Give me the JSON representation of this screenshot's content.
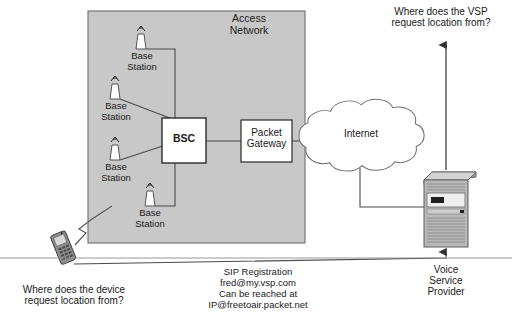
{
  "diagram": {
    "colors": {
      "access_network_fill": "#c8c8c8",
      "node_fill": "#ffffff",
      "stroke": "#444444",
      "text": "#1a1a1a",
      "server_body": "#b4b4b4",
      "server_dark": "#8c8c8c"
    }
  },
  "access_network": {
    "label": "Access\nNetwork",
    "base_stations": [
      {
        "label": "Base\nStation",
        "antenna_icon": "antenna-icon"
      },
      {
        "label": "Base\nStation",
        "antenna_icon": "antenna-icon"
      },
      {
        "label": "Base\nStation",
        "antenna_icon": "antenna-icon"
      },
      {
        "label": "Base\nStation",
        "antenna_icon": "antenna-icon"
      }
    ],
    "bsc": {
      "label": "BSC"
    },
    "packet_gateway": {
      "label": "Packet\nGateway"
    }
  },
  "internet": {
    "label": "Internet",
    "icon": "cloud-icon"
  },
  "voice_service_provider": {
    "label": "Voice\nService\nProvider",
    "icon": "server-tower-icon"
  },
  "device": {
    "icon": "mobile-phone-icon"
  },
  "questions": {
    "device": "Where does the device\nrequest location from?",
    "vsp": "Where does the VSP\nrequest location from?"
  },
  "sip_registration": {
    "title": "SIP Registration",
    "address": "fred@my.vsp.com",
    "reach_label": "Can be reached at",
    "reach_address": "IP@freetoair.packet.net"
  }
}
